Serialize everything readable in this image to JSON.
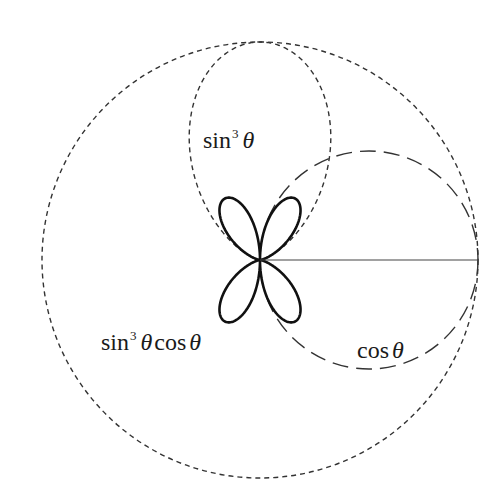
{
  "diagram": {
    "type": "polar-curves",
    "origin": {
      "x": 260,
      "y": 260
    },
    "scale_radius": 218,
    "curves": [
      {
        "id": "outer-circle",
        "equation": "r = 1",
        "style": "short-dash",
        "color": "#333333"
      },
      {
        "id": "sin3",
        "equation": "r = sin^3 θ",
        "style": "short-dash",
        "color": "#333333"
      },
      {
        "id": "cos",
        "equation": "r = cos θ",
        "style": "long-dash",
        "color": "#333333"
      },
      {
        "id": "rose",
        "equation": "r = sin^3 θ cos θ",
        "style": "solid-thick",
        "color": "#111111"
      }
    ],
    "radius_line": {
      "from": [
        260,
        260
      ],
      "to": [
        478,
        260
      ]
    }
  },
  "labels": {
    "sin3": {
      "func": "sin",
      "power": "3",
      "var": "θ"
    },
    "rose": {
      "func": "sin",
      "power": "3",
      "var": "θ",
      "func2": "cos",
      "var2": "θ"
    },
    "cos": {
      "func": "cos",
      "var": "θ"
    }
  }
}
